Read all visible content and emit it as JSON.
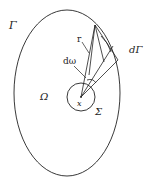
{
  "diagram": {
    "labels": {
      "boundary": "Γ",
      "radius": "r",
      "solid_angle": "dω",
      "boundary_element": "dΓ",
      "domain": "Ω",
      "point": "x",
      "sphere": "Σ"
    },
    "colors": {
      "stroke": "#222222",
      "background": "#ffffff"
    }
  }
}
